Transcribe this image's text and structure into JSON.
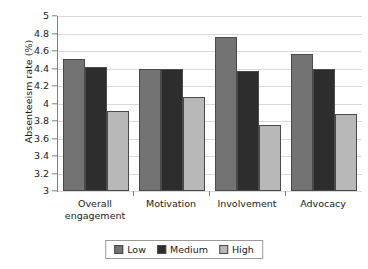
{
  "chart_data": {
    "type": "bar",
    "title": "",
    "xlabel": "",
    "ylabel": "Absenteeism rate (%)",
    "ylim": [
      3,
      5
    ],
    "ytick_step": 0.2,
    "grid": true,
    "legend_position": "bottom",
    "categories": [
      "Overall engagement",
      "Motivation",
      "Involvement",
      "Advocacy"
    ],
    "yticks": [
      "5",
      "4.8",
      "4.6",
      "4.4",
      "4.2",
      "4",
      "3.8",
      "3.6",
      "3.4",
      "3.2",
      "3"
    ],
    "series": [
      {
        "name": "Low",
        "color": "#737373",
        "values": [
          4.51,
          4.4,
          4.76,
          4.57
        ]
      },
      {
        "name": "Medium",
        "color": "#2d2d2d",
        "values": [
          4.42,
          4.4,
          4.37,
          4.39
        ]
      },
      {
        "name": "High",
        "color": "#b8b8b8",
        "values": [
          3.91,
          4.07,
          3.75,
          3.88
        ]
      }
    ]
  },
  "axis": {
    "y_title": "Absenteeism rate (%)"
  },
  "legend": {
    "items": [
      {
        "label": "Low",
        "color": "#737373"
      },
      {
        "label": "Medium",
        "color": "#2d2d2d"
      },
      {
        "label": "High",
        "color": "#b8b8b8"
      }
    ]
  }
}
